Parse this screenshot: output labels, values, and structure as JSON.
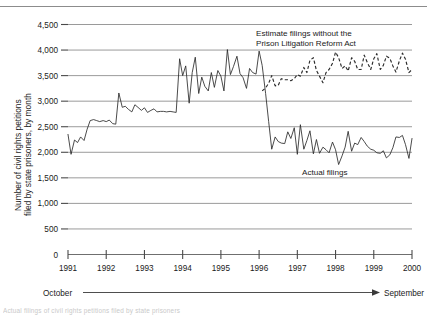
{
  "chart_data": {
    "type": "line",
    "title": "",
    "ylabel_line1": "Number of civil rights petitions",
    "ylabel_line2": "filed by state prisoners, by month",
    "xlabel": "",
    "ylim": [
      0,
      4500
    ],
    "yticks": [
      0,
      500,
      1000,
      1500,
      2000,
      2500,
      3000,
      3500,
      4000,
      4500
    ],
    "ytick_labels": [
      "0",
      "500",
      "1,000",
      "1,500",
      "2,000",
      "2,500",
      "3,000",
      "3,500",
      "4,000",
      "4,500"
    ],
    "xlim": [
      1991,
      2000
    ],
    "xticks": [
      1991,
      1992,
      1993,
      1994,
      1995,
      1996,
      1997,
      1998,
      1999,
      2000
    ],
    "xtick_labels": [
      "1991",
      "1992",
      "1993",
      "1994",
      "1995",
      "1996",
      "1997",
      "1998",
      "1999",
      "2000"
    ],
    "grid": true,
    "grid_axis": "y",
    "legend_position": "inline-annotations",
    "annotations": [
      {
        "name": "estimate-annotation",
        "line1": "Estimate filings without the",
        "line2": "Prison Litigation Reform Act"
      },
      {
        "name": "actual-annotation",
        "text": "Actual filings"
      }
    ],
    "axis_span": {
      "start_label": "October",
      "end_label": "September"
    },
    "series": [
      {
        "name": "Actual filings",
        "style": "solid",
        "color": "#2b2b2b",
        "x": [
          1991.0,
          1991.08,
          1991.17,
          1991.25,
          1991.33,
          1991.42,
          1991.5,
          1991.58,
          1991.67,
          1991.75,
          1991.83,
          1991.92,
          1992.0,
          1992.08,
          1992.17,
          1992.25,
          1992.33,
          1992.42,
          1992.5,
          1992.58,
          1992.67,
          1992.75,
          1992.83,
          1992.92,
          1993.0,
          1993.08,
          1993.17,
          1993.25,
          1993.33,
          1993.42,
          1993.5,
          1993.58,
          1993.67,
          1993.75,
          1993.83,
          1993.92,
          1994.0,
          1994.08,
          1994.17,
          1994.25,
          1994.33,
          1994.42,
          1994.5,
          1994.58,
          1994.67,
          1994.75,
          1994.83,
          1994.92,
          1995.0,
          1995.08,
          1995.17,
          1995.25,
          1995.33,
          1995.42,
          1995.5,
          1995.58,
          1995.67,
          1995.75,
          1995.83,
          1995.92,
          1996.0,
          1996.08,
          1996.17,
          1996.25,
          1996.33,
          1996.42,
          1996.5,
          1996.58,
          1996.67,
          1996.75,
          1996.83,
          1996.92,
          1997.0,
          1997.08,
          1997.17,
          1997.25,
          1997.33,
          1997.42,
          1997.5,
          1997.58,
          1997.67,
          1997.75,
          1997.83,
          1997.92,
          1998.0,
          1998.08,
          1998.17,
          1998.25,
          1998.33,
          1998.42,
          1998.5,
          1998.58,
          1998.67,
          1998.75,
          1998.83,
          1998.92,
          1999.0,
          1999.08,
          1999.17,
          1999.25,
          1999.33,
          1999.42,
          1999.5,
          1999.58,
          1999.67,
          1999.75,
          1999.83,
          1999.92,
          2000.0
        ],
        "values": [
          2350,
          1960,
          2240,
          2190,
          2300,
          2230,
          2450,
          2620,
          2640,
          2620,
          2600,
          2620,
          2600,
          2630,
          2560,
          2550,
          3160,
          2880,
          2900,
          2840,
          2790,
          2930,
          2880,
          2820,
          2870,
          2780,
          2820,
          2850,
          2790,
          2800,
          2800,
          2790,
          2800,
          2790,
          2780,
          3830,
          3500,
          3690,
          2960,
          3560,
          3860,
          3150,
          3470,
          3290,
          3200,
          3560,
          3270,
          3600,
          3490,
          3200,
          4010,
          3520,
          3680,
          3880,
          3540,
          3460,
          3250,
          3640,
          3560,
          3530,
          3980,
          3700,
          3150,
          2600,
          2060,
          2300,
          2210,
          2180,
          2170,
          2400,
          2270,
          2480,
          1960,
          2540,
          2060,
          2230,
          2420,
          1970,
          2250,
          1980,
          2100,
          2050,
          1990,
          2200,
          2050,
          1760,
          1930,
          2100,
          2410,
          2020,
          2180,
          2150,
          2290,
          2210,
          2120,
          2060,
          2040,
          1990,
          1980,
          2030,
          1890,
          1950,
          2090,
          2300,
          2290,
          2330,
          2150,
          1880,
          2270
        ]
      },
      {
        "name": "Estimate filings without the Prison Litigation Reform Act",
        "style": "dashed",
        "color": "#2b2b2b",
        "x": [
          1996.08,
          1996.17,
          1996.25,
          1996.33,
          1996.42,
          1996.5,
          1996.58,
          1996.67,
          1996.75,
          1996.83,
          1996.92,
          1997.0,
          1997.08,
          1997.17,
          1997.25,
          1997.33,
          1997.42,
          1997.5,
          1997.58,
          1997.67,
          1997.75,
          1997.83,
          1997.92,
          1998.0,
          1998.08,
          1998.17,
          1998.25,
          1998.33,
          1998.42,
          1998.5,
          1998.58,
          1998.67,
          1998.75,
          1998.83,
          1998.92,
          1999.0,
          1999.08,
          1999.17,
          1999.25,
          1999.33,
          1999.42,
          1999.5,
          1999.58,
          1999.67,
          1999.75,
          1999.83,
          1999.92,
          2000.0
        ],
        "values": [
          3200,
          3260,
          3350,
          3500,
          3300,
          3310,
          3440,
          3420,
          3420,
          3400,
          3440,
          3520,
          3490,
          3660,
          3560,
          3800,
          3850,
          3600,
          3490,
          3360,
          3560,
          3620,
          3740,
          3960,
          3850,
          3640,
          3690,
          3590,
          3850,
          3780,
          3620,
          3620,
          3900,
          3760,
          3620,
          3830,
          3930,
          3620,
          3700,
          3880,
          3840,
          3690,
          3570,
          3790,
          3940,
          3820,
          3560,
          3620
        ]
      }
    ]
  },
  "footnote": {
    "text": "Actual filings of civil rights petitions filed by state prisoners"
  }
}
